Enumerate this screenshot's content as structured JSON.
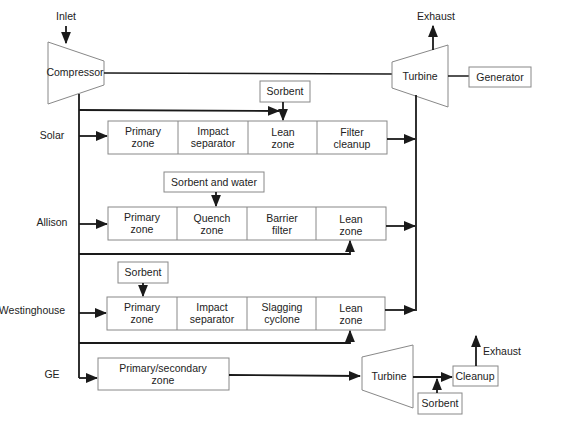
{
  "diagram": {
    "type": "process-flow",
    "inlet_label": "Inlet",
    "compressor_label": "Compressor",
    "turbine_label": "Turbine",
    "exhaust_label": "Exhaust",
    "generator_label": "Generator",
    "rows": [
      {
        "name": "Solar",
        "injection": {
          "label": "Sorbent",
          "target_stage": 2
        },
        "stages": [
          {
            "line1": "Primary",
            "line2": "zone"
          },
          {
            "line1": "Impact",
            "line2": "separator"
          },
          {
            "line1": "Lean",
            "line2": "zone"
          },
          {
            "line1": "Filter",
            "line2": "cleanup"
          }
        ]
      },
      {
        "name": "Allison",
        "injection": {
          "label": "Sorbent and water",
          "target_stage": 1
        },
        "stages": [
          {
            "line1": "Primary",
            "line2": "zone"
          },
          {
            "line1": "Quench",
            "line2": "zone"
          },
          {
            "line1": "Barrier",
            "line2": "filter"
          },
          {
            "line1": "Lean",
            "line2": "zone"
          }
        ]
      },
      {
        "name": "Westinghouse",
        "injection": {
          "label": "Sorbent",
          "target_stage": 0
        },
        "stages": [
          {
            "line1": "Primary",
            "line2": "zone"
          },
          {
            "line1": "Impact",
            "line2": "separator"
          },
          {
            "line1": "Slagging",
            "line2": "cyclone"
          },
          {
            "line1": "Lean",
            "line2": "zone"
          }
        ]
      },
      {
        "name": "GE",
        "stages": [
          {
            "line1": "Primary/secondary",
            "line2": "zone"
          }
        ],
        "turbine_label": "Turbine",
        "sorbent_label": "Sorbent",
        "cleanup_label": "Cleanup",
        "exhaust_label": "Exhaust"
      }
    ]
  }
}
